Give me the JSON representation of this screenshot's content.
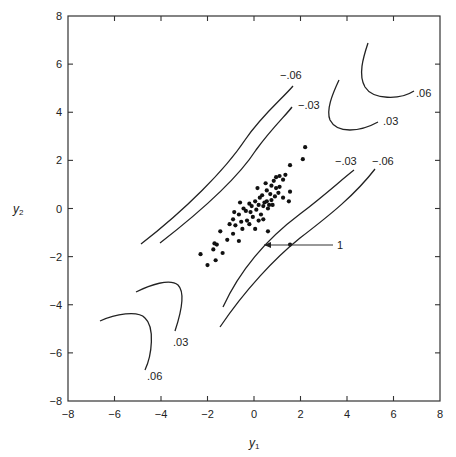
{
  "chart_data": {
    "type": "scatter",
    "title": "",
    "xlabel": "y1",
    "ylabel": "y2",
    "xlim": [
      -8,
      8
    ],
    "ylim": [
      -8,
      8
    ],
    "xticks": [
      -8,
      -6,
      -4,
      -2,
      0,
      2,
      4,
      6,
      8
    ],
    "yticks": [
      -8,
      -6,
      -4,
      -2,
      0,
      2,
      4,
      6,
      8
    ],
    "xtick_labels": [
      "−8",
      "−6",
      "−4",
      "−2",
      "0",
      "2",
      "4",
      "6",
      "8"
    ],
    "ytick_labels": [
      "−8",
      "−6",
      "−4",
      "−2",
      "0",
      "2",
      "4",
      "6",
      "8"
    ],
    "grid": false,
    "legend": null,
    "points": [
      [
        2.2,
        2.55
      ],
      [
        2.1,
        2.05
      ],
      [
        1.55,
        1.8
      ],
      [
        1.35,
        1.4
      ],
      [
        1.25,
        1.2
      ],
      [
        1.1,
        1.35
      ],
      [
        0.95,
        1.3
      ],
      [
        0.85,
        1.15
      ],
      [
        0.75,
        0.95
      ],
      [
        0.95,
        0.85
      ],
      [
        1.1,
        0.9
      ],
      [
        0.5,
        1.05
      ],
      [
        0.55,
        0.75
      ],
      [
        0.7,
        0.6
      ],
      [
        0.9,
        0.5
      ],
      [
        1.25,
        0.45
      ],
      [
        1.55,
        0.7
      ],
      [
        1.5,
        0.3
      ],
      [
        0.35,
        0.55
      ],
      [
        0.55,
        0.3
      ],
      [
        0.8,
        0.15
      ],
      [
        0.15,
        0.85
      ],
      [
        0.6,
        0.0
      ],
      [
        0.4,
        0.1
      ],
      [
        0.2,
        0.15
      ],
      [
        0.05,
        0.3
      ],
      [
        -0.1,
        0.1
      ],
      [
        -0.2,
        0.2
      ],
      [
        -0.45,
        0.0
      ],
      [
        -0.6,
        0.25
      ],
      [
        -0.35,
        -0.1
      ],
      [
        0.1,
        -0.05
      ],
      [
        0.3,
        -0.25
      ],
      [
        -0.05,
        -0.35
      ],
      [
        0.4,
        -0.45
      ],
      [
        -0.3,
        -0.5
      ],
      [
        -0.65,
        -0.25
      ],
      [
        -0.85,
        -0.15
      ],
      [
        -0.9,
        -0.45
      ],
      [
        -0.55,
        -0.55
      ],
      [
        -1.05,
        -0.65
      ],
      [
        -0.8,
        -0.7
      ],
      [
        -0.2,
        -0.65
      ],
      [
        0.05,
        -0.85
      ],
      [
        -0.5,
        -0.85
      ],
      [
        -0.9,
        -1.05
      ],
      [
        -1.45,
        -0.95
      ],
      [
        0.6,
        -0.95
      ],
      [
        -0.65,
        -1.35
      ],
      [
        -1.15,
        -1.3
      ],
      [
        -1.6,
        -1.5
      ],
      [
        -1.7,
        -1.45
      ],
      [
        -1.75,
        -1.7
      ],
      [
        -1.35,
        -1.85
      ],
      [
        -2.3,
        -1.9
      ],
      [
        -1.65,
        -2.15
      ],
      [
        -2.0,
        -2.35
      ],
      [
        0.25,
        0.45
      ],
      [
        0.45,
        0.25
      ],
      [
        1.05,
        0.65
      ],
      [
        0.75,
        0.35
      ],
      [
        -0.15,
        -0.15
      ],
      [
        0.2,
        -0.5
      ],
      [
        0.65,
        0.15
      ]
    ],
    "annotated_point": {
      "x": 1.55,
      "y": -1.5,
      "label": "1"
    },
    "contours": [
      {
        "level": "-.06",
        "label": "−.06",
        "side": "upper-left band"
      },
      {
        "level": "-.03",
        "label": "−.03",
        "side": "upper-left band"
      },
      {
        "level": "-.03",
        "label": "−.03",
        "side": "lower-right band"
      },
      {
        "level": "-.06",
        "label": "−.06",
        "side": "lower-right band"
      },
      {
        "level": ".03",
        "label": ".03",
        "side": "upper-right corner"
      },
      {
        "level": ".06",
        "label": ".06",
        "side": "upper-right corner"
      },
      {
        "level": ".03",
        "label": ".03",
        "side": "lower-left corner"
      },
      {
        "level": ".06",
        "label": ".06",
        "side": "lower-left corner"
      }
    ]
  },
  "axes": {
    "xlabel_main": "y",
    "xlabel_sub": "1",
    "ylabel_main": "y",
    "ylabel_sub": "2"
  },
  "labels": {
    "neg06_upper": "−.06",
    "neg03_upper": "−.03",
    "neg03_lower": "−.03",
    "neg06_lower": "−.06",
    "pos06_upper": ".06",
    "pos03_upper": ".03",
    "pos03_lower": ".03",
    "pos06_lower": ".06",
    "point_annotation": "1"
  }
}
